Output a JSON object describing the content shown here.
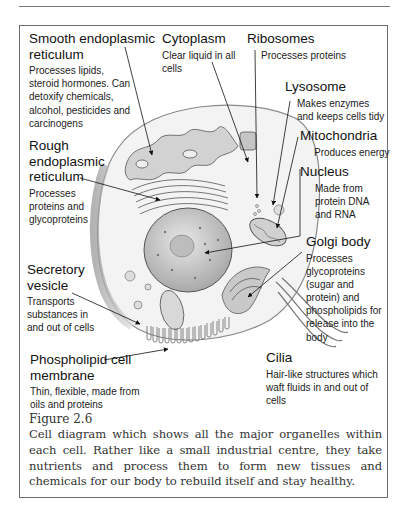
{
  "figure": {
    "number": "Figure 2.6",
    "caption": "Cell diagram which shows all the major organelles within each cell. Rather like a small industrial centre, they take nutrients and process them to form new tissues and chemicals for our body to rebuild itself and stay healthy."
  },
  "labels": {
    "smooth_er": {
      "title_1": "Smooth endoplasmic",
      "title_2": "reticulum",
      "desc": "Processes lipids, steroid hormones. Can detoxify chemicals, alcohol, pesticides and carcinogens"
    },
    "cytoplasm": {
      "title": "Cytoplasm",
      "desc": "Clear liquid in all cells"
    },
    "ribosomes": {
      "title": "Ribosomes",
      "desc": "Processes proteins"
    },
    "lysosome": {
      "title": "Lysosome",
      "desc": "Makes enzymes and keeps cells tidy"
    },
    "mitochondria": {
      "title": "Mitochondria",
      "desc": "Produces energy"
    },
    "nucleus": {
      "title": "Nucleus",
      "desc": "Made from protein DNA and RNA"
    },
    "rough_er": {
      "title_1": "Rough",
      "title_2": "endoplasmic",
      "title_3": "reticulum",
      "desc": "Processes proteins and glycoproteins"
    },
    "golgi": {
      "title": "Golgi body",
      "desc": "Processes glycoproteins (sugar and protein) and phospholipids for release into the body"
    },
    "secretory_vesicle": {
      "title_1": "Secretory",
      "title_2": "vesicle",
      "desc": "Transports substances in and out of cells"
    },
    "cell_membrane": {
      "title_1": "Phospholipid cell",
      "title_2": "membrane",
      "desc": "Thin, flexible, made from oils and proteins"
    },
    "cilia": {
      "title": "Cilia",
      "desc": "Hair-like structures which waft fluids in and out of cells"
    }
  },
  "colors": {
    "line": "#1a1a1a",
    "frame": "#6d6d6d",
    "shade": "#c8c8c8",
    "caption": "#333333"
  }
}
